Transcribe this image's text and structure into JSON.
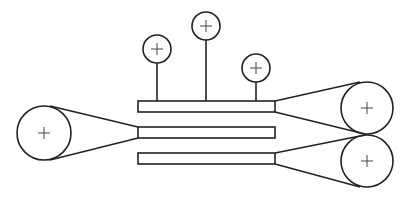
{
  "diagram": {
    "title": "",
    "colors": {
      "stroke": "#222222",
      "background": "#ffffff"
    },
    "bars": [
      {
        "id": "bar-top",
        "x": 138,
        "y": 101,
        "w": 137,
        "h": 11
      },
      {
        "id": "bar-middle",
        "x": 138,
        "y": 127,
        "w": 137,
        "h": 11
      },
      {
        "id": "bar-bottom",
        "x": 138,
        "y": 153,
        "w": 137,
        "h": 11
      }
    ],
    "small_pulleys": [
      {
        "id": "small-pulley-left",
        "cx": 157,
        "cy": 49,
        "r": 14,
        "stem_to_y": 101
      },
      {
        "id": "small-pulley-center",
        "cx": 206,
        "cy": 26,
        "r": 14,
        "stem_to_y": 101
      },
      {
        "id": "small-pulley-right",
        "cx": 256,
        "cy": 68,
        "r": 14,
        "stem_to_y": 101
      }
    ],
    "large_pulleys": [
      {
        "id": "large-pulley-left",
        "cx": 44,
        "cy": 133,
        "r": 27
      },
      {
        "id": "large-pulley-right-top",
        "cx": 367,
        "cy": 108,
        "r": 26
      },
      {
        "id": "large-pulley-right-bottom",
        "cx": 367,
        "cy": 161,
        "r": 26
      }
    ],
    "belts": [
      {
        "id": "belt-left-upper",
        "x1": 50,
        "y1": 106,
        "x2": 138,
        "y2": 127
      },
      {
        "id": "belt-left-lower",
        "x1": 50,
        "y1": 160,
        "x2": 138,
        "y2": 138
      },
      {
        "id": "belt-right-top-upper",
        "x1": 275,
        "y1": 101,
        "x2": 360,
        "y2": 82
      },
      {
        "id": "belt-right-top-lower",
        "x1": 275,
        "y1": 112,
        "x2": 365,
        "y2": 134
      },
      {
        "id": "belt-right-bottom-upper",
        "x1": 275,
        "y1": 153,
        "x2": 365,
        "y2": 135
      },
      {
        "id": "belt-right-bottom-lower",
        "x1": 275,
        "y1": 164,
        "x2": 360,
        "y2": 187
      }
    ]
  }
}
